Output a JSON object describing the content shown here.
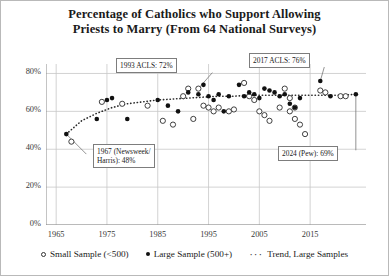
{
  "chart_data": {
    "type": "scatter",
    "title": "Percentage of Catholics who Support Allowing Priests to Marry (From 64 National Surveys)",
    "title_line1": "Percentage of Catholics who Support Allowing",
    "title_line2": "Priests to Marry (From 64 National Surveys)",
    "xlabel": "",
    "ylabel": "",
    "xlim": [
      1963,
      2026
    ],
    "ylim": [
      0,
      85
    ],
    "xticks": [
      1965,
      1975,
      1985,
      1995,
      2005,
      2015
    ],
    "xticklabels": [
      "1965",
      "1975",
      "1985",
      "1995",
      "2005",
      "2015"
    ],
    "yticks": [
      0,
      20,
      40,
      60,
      80
    ],
    "yticklabels": [
      "0%",
      "20%",
      "40%",
      "60%",
      "80%"
    ],
    "grid": true,
    "legend_position": "below",
    "series": [
      {
        "name": "Small Sample (<500)",
        "marker": "open-circle",
        "points": [
          [
            1968,
            44
          ],
          [
            1974,
            65
          ],
          [
            1978,
            64
          ],
          [
            1983,
            63
          ],
          [
            1986,
            55
          ],
          [
            1988,
            53
          ],
          [
            1990,
            68
          ],
          [
            1991,
            72
          ],
          [
            1992,
            56
          ],
          [
            1993,
            72
          ],
          [
            1994,
            63
          ],
          [
            1995,
            62
          ],
          [
            1996,
            60
          ],
          [
            1997,
            62
          ],
          [
            1999,
            60
          ],
          [
            2000,
            61
          ],
          [
            2002,
            75
          ],
          [
            2003,
            68
          ],
          [
            2004,
            66
          ],
          [
            2005,
            60
          ],
          [
            2006,
            58
          ],
          [
            2007,
            55
          ],
          [
            2009,
            62
          ],
          [
            2010,
            72
          ],
          [
            2011,
            67
          ],
          [
            2011,
            60
          ],
          [
            2012,
            56
          ],
          [
            2012,
            62
          ],
          [
            2013,
            53
          ],
          [
            2014,
            48
          ],
          [
            2017,
            71
          ],
          [
            2018,
            70
          ],
          [
            2021,
            68
          ],
          [
            2022,
            68
          ]
        ]
      },
      {
        "name": "Large Sample (500+)",
        "marker": "filled-circle",
        "points": [
          [
            1967,
            48
          ],
          [
            1973,
            56
          ],
          [
            1975,
            66
          ],
          [
            1976,
            67
          ],
          [
            1979,
            56
          ],
          [
            1985,
            66
          ],
          [
            1987,
            63
          ],
          [
            1989,
            60
          ],
          [
            1991,
            70
          ],
          [
            1993,
            69
          ],
          [
            1994,
            74
          ],
          [
            1995,
            68
          ],
          [
            1996,
            66
          ],
          [
            1997,
            69
          ],
          [
            1998,
            60
          ],
          [
            1999,
            68
          ],
          [
            2001,
            74
          ],
          [
            2002,
            68
          ],
          [
            2003,
            70
          ],
          [
            2004,
            69
          ],
          [
            2005,
            67
          ],
          [
            2006,
            72
          ],
          [
            2007,
            71
          ],
          [
            2008,
            70
          ],
          [
            2009,
            68
          ],
          [
            2010,
            69
          ],
          [
            2011,
            64
          ],
          [
            2012,
            62
          ],
          [
            2013,
            67
          ],
          [
            2017,
            76
          ],
          [
            2019,
            68
          ],
          [
            2024,
            69
          ]
        ]
      }
    ],
    "trend": {
      "name": "Trend, Large Samples",
      "style": "dotted",
      "points": [
        [
          1967,
          48
        ],
        [
          1970,
          55
        ],
        [
          1973,
          59
        ],
        [
          1976,
          62
        ],
        [
          1979,
          64
        ],
        [
          1982,
          65
        ],
        [
          1985,
          66
        ],
        [
          1988,
          66.5
        ],
        [
          1991,
          67
        ],
        [
          1994,
          67.5
        ],
        [
          1997,
          68
        ],
        [
          2000,
          68
        ],
        [
          2003,
          68.5
        ],
        [
          2006,
          68.5
        ],
        [
          2009,
          68.5
        ],
        [
          2012,
          68.5
        ],
        [
          2015,
          68.5
        ],
        [
          2018,
          68.5
        ],
        [
          2021,
          68.5
        ],
        [
          2024,
          69
        ]
      ]
    },
    "annotations": [
      {
        "id": "a1993",
        "text": "1993 ACLS: 72%",
        "target": [
          1993,
          72
        ]
      },
      {
        "id": "a2017",
        "text": "2017 ACLS: 76%",
        "target": [
          2017,
          76
        ]
      },
      {
        "id": "a1967",
        "text": "1967 (Newsweek/\nHarris): 48%",
        "target": [
          1967,
          48
        ]
      },
      {
        "id": "a2024",
        "text": "2024 (Pew): 69%",
        "target": [
          2024,
          69
        ]
      }
    ]
  },
  "legend": {
    "small_label": "Small Sample (<500)",
    "large_label": "Large Sample (500+)",
    "trend_label": "Trend, Large Samples",
    "trend_glyph": "···"
  }
}
